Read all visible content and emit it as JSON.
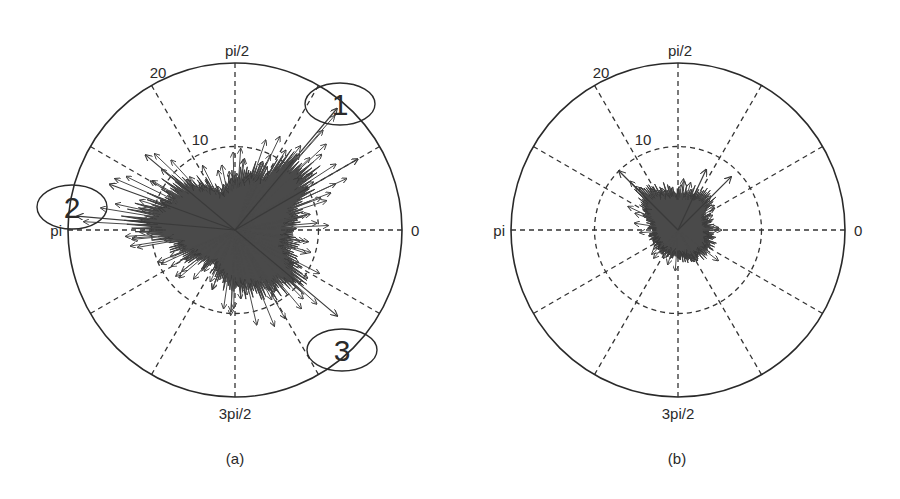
{
  "figure": {
    "panels": [
      {
        "id": "a",
        "caption": "(a)",
        "center": [
          235,
          230
        ],
        "radius_px": 167,
        "angle_labels": {
          "right": "0",
          "top": "pi/2",
          "left": "pi",
          "bottom": "3pi/2"
        },
        "radial_labels": {
          "outer": "20",
          "inner": "10"
        },
        "annotations": [
          {
            "label": "1",
            "cx": 340,
            "cy": 104,
            "rx": 35,
            "ry": 21
          },
          {
            "label": "2",
            "cx": 72,
            "cy": 207,
            "rx": 35,
            "ry": 22
          },
          {
            "label": "3",
            "cx": 342,
            "cy": 350,
            "rx": 35,
            "ry": 21
          }
        ]
      },
      {
        "id": "b",
        "caption": "(b)",
        "center": [
          678,
          230
        ],
        "radius_px": 167,
        "angle_labels": {
          "right": "0",
          "top": "pi/2",
          "left": "pi",
          "bottom": "3pi/2"
        },
        "radial_labels": {
          "outer": "20",
          "inner": "10"
        },
        "annotations": []
      }
    ],
    "colors": {
      "ink": "#2a2a2a",
      "blob": "#4a4a4a",
      "grid": "#333333",
      "background": "#ffffff"
    }
  },
  "chart_data": [
    {
      "type": "polar-quiver",
      "title": "(a)",
      "rlim": [
        0,
        20
      ],
      "rticks": [
        10,
        20
      ],
      "theta_ticks": [
        "0",
        "pi/2",
        "pi",
        "3pi/2"
      ],
      "theta_grid_deg": [
        0,
        30,
        60,
        90,
        120,
        150,
        180,
        210,
        240,
        270,
        300,
        330
      ],
      "grid": true,
      "description": "Dense cloud of vectors from the origin; most magnitudes below ~10, with long outlier arrows reaching toward the outer ring",
      "envelope": [
        {
          "theta_deg": 0,
          "r": 11
        },
        {
          "theta_deg": 20,
          "r": 13
        },
        {
          "theta_deg": 30,
          "r": 17
        },
        {
          "theta_deg": 50,
          "r": 19
        },
        {
          "theta_deg": 60,
          "r": 13
        },
        {
          "theta_deg": 80,
          "r": 11
        },
        {
          "theta_deg": 90,
          "r": 10
        },
        {
          "theta_deg": 110,
          "r": 8
        },
        {
          "theta_deg": 140,
          "r": 14
        },
        {
          "theta_deg": 160,
          "r": 16
        },
        {
          "theta_deg": 175,
          "r": 19
        },
        {
          "theta_deg": 190,
          "r": 13
        },
        {
          "theta_deg": 210,
          "r": 10
        },
        {
          "theta_deg": 240,
          "r": 8
        },
        {
          "theta_deg": 265,
          "r": 11
        },
        {
          "theta_deg": 300,
          "r": 13
        },
        {
          "theta_deg": 320,
          "r": 16
        },
        {
          "theta_deg": 340,
          "r": 11
        }
      ],
      "annotations": [
        {
          "label": "1",
          "theta_deg": 48,
          "r": 19
        },
        {
          "label": "2",
          "theta_deg": 172,
          "r": 19
        },
        {
          "label": "3",
          "theta_deg": 322,
          "r": 18
        }
      ]
    },
    {
      "type": "polar-quiver",
      "title": "(b)",
      "rlim": [
        0,
        20
      ],
      "rticks": [
        10,
        20
      ],
      "theta_ticks": [
        "0",
        "pi/2",
        "pi",
        "3pi/2"
      ],
      "theta_grid_deg": [
        0,
        30,
        60,
        90,
        120,
        150,
        180,
        210,
        240,
        270,
        300,
        330
      ],
      "grid": true,
      "description": "Compact cloud of vectors; nearly all magnitudes below ~6, a few arrows reaching ~9-10",
      "envelope": [
        {
          "theta_deg": 0,
          "r": 6
        },
        {
          "theta_deg": 30,
          "r": 6
        },
        {
          "theta_deg": 45,
          "r": 9
        },
        {
          "theta_deg": 65,
          "r": 8
        },
        {
          "theta_deg": 90,
          "r": 7
        },
        {
          "theta_deg": 135,
          "r": 10
        },
        {
          "theta_deg": 160,
          "r": 6
        },
        {
          "theta_deg": 180,
          "r": 5
        },
        {
          "theta_deg": 210,
          "r": 5
        },
        {
          "theta_deg": 270,
          "r": 5
        },
        {
          "theta_deg": 330,
          "r": 7
        }
      ]
    }
  ]
}
